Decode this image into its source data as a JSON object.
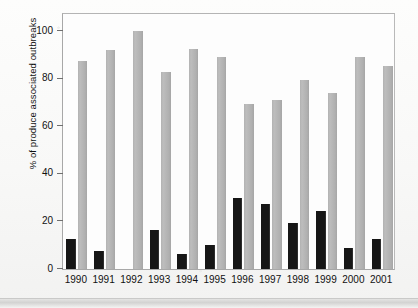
{
  "chart_data": {
    "type": "bar",
    "title": "",
    "xlabel": "",
    "ylabel": "% of produce associated outbreaks",
    "ylim": [
      0,
      108
    ],
    "yticks": [
      0,
      20,
      40,
      60,
      80,
      100
    ],
    "ytick_labels": [
      "0",
      "20",
      "40",
      "60",
      "80",
      "100"
    ],
    "grid": false,
    "legend": "none",
    "categories": [
      "1990",
      "1991",
      "1992",
      "1993",
      "1994",
      "1995",
      "1996",
      "1997",
      "1998",
      "1999",
      "2000",
      "2001"
    ],
    "series": [
      {
        "name": "black-series",
        "color": "#161616",
        "values": [
          12.5,
          7.5,
          0,
          16.5,
          6.5,
          10,
          30,
          27.5,
          19.5,
          24.5,
          9,
          12.5
        ]
      },
      {
        "name": "gray-series",
        "color": "#b4b4b4",
        "values": [
          87.5,
          92,
          100,
          83,
          92.5,
          89,
          69.5,
          71,
          79.5,
          74,
          89,
          85.5
        ]
      }
    ]
  },
  "axis": {
    "tick_labels": [
      "0",
      "20",
      "40",
      "60",
      "80",
      "100"
    ],
    "y_title": "% of produce associated outbreaks"
  },
  "xaxis": {
    "labels": [
      "1990",
      "1991",
      "1992",
      "1993",
      "1994",
      "1995",
      "1996",
      "1997",
      "1998",
      "1999",
      "2000",
      "2001"
    ]
  }
}
